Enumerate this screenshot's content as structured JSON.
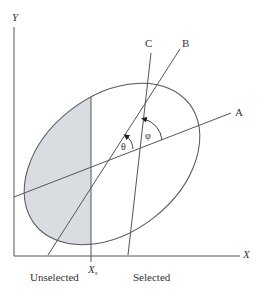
{
  "diagram": {
    "axes": {
      "x_label": "X",
      "y_label": "Y"
    },
    "threshold": {
      "label": "X",
      "subscript": "s"
    },
    "regions": {
      "left_label": "Unselected",
      "right_label": "Selected"
    },
    "lines": [
      {
        "label": "A"
      },
      {
        "label": "B"
      },
      {
        "label": "C"
      }
    ],
    "angles": {
      "theta": "θ",
      "phi": "φ"
    },
    "colors": {
      "stroke": "#555555",
      "shade": "#d9dde2",
      "text": "#333333"
    }
  }
}
